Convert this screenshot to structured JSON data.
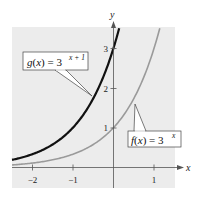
{
  "chart_data": {
    "type": "line",
    "title": "",
    "xlabel": "x",
    "ylabel": "y",
    "xlim": [
      -2.5,
      1.15
    ],
    "ylim": [
      0,
      3.5
    ],
    "grid": false,
    "x_ticks": [
      -2,
      -1,
      1
    ],
    "x_tick_labels": [
      "−2",
      "−1",
      "1"
    ],
    "y_ticks": [
      1,
      2,
      3
    ],
    "y_tick_labels": [
      "1",
      "2",
      "3"
    ],
    "series": [
      {
        "name": "g(x) = 3^(x+1)",
        "label_main": "g(x) = 3",
        "label_exp": "x + 1",
        "color": "#111111",
        "x": [
          -2.5,
          -2,
          -1.5,
          -1,
          -0.5,
          0,
          0.14
        ],
        "values": [
          0.19,
          0.33,
          0.58,
          1,
          1.73,
          3,
          3.5
        ]
      },
      {
        "name": "f(x) = 3^x",
        "label_main": "f(x) = 3",
        "label_exp": "x",
        "color": "#9a9a9a",
        "x": [
          -2.5,
          -2,
          -1,
          0,
          0.5,
          1,
          1.14
        ],
        "values": [
          0.06,
          0.11,
          0.33,
          1,
          1.73,
          3,
          3.5
        ]
      }
    ],
    "annotations": [
      {
        "text": "g(x) = 3^(x+1)",
        "points_to": [
          -0.5,
          1.73
        ]
      },
      {
        "text": "f(x) = 3^x",
        "points_to": [
          0.5,
          1.73
        ]
      }
    ],
    "background": "#ececec"
  }
}
